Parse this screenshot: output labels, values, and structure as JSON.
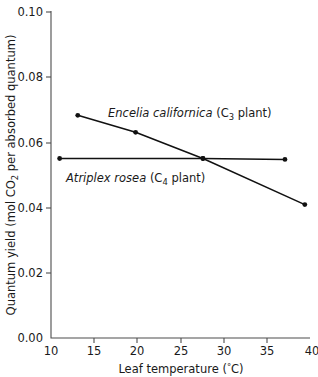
{
  "chart_data": {
    "type": "line",
    "title": "",
    "xlabel": "Leaf temperature (°C)",
    "ylabel": "Quantum yield (mol CO2 per absorbed quantum)",
    "xlim": [
      10,
      40
    ],
    "ylim": [
      0.0,
      0.1
    ],
    "grid": false,
    "legend_position": "inline-annotations",
    "xticks": [
      10,
      15,
      20,
      25,
      30,
      35,
      40
    ],
    "xtick_labels": [
      "10",
      "15",
      "20",
      "25",
      "30",
      "35",
      "40"
    ],
    "yticks": [
      0.0,
      0.02,
      0.04,
      0.06,
      0.08,
      0.1
    ],
    "ytick_labels": [
      "0.00",
      "0.02",
      "0.04",
      "0.06",
      "0.08",
      "0.10"
    ],
    "series": [
      {
        "name": "Encelia californica (C3 plant)",
        "species": "Encelia californica",
        "pathway_prefix": "(C",
        "pathway_number": "3",
        "pathway_suffix": " plant)",
        "marker": "filled-circle",
        "color": "#111111",
        "x": [
          13.1,
          19.8,
          27.6,
          39.4
        ],
        "y": [
          0.0681,
          0.0629,
          0.0549,
          0.0408
        ]
      },
      {
        "name": "Atriplex rosea (C4 plant)",
        "species": "Atriplex rosea",
        "pathway_prefix": "(C",
        "pathway_number": "4",
        "pathway_suffix": " plant)",
        "marker": "filled-circle",
        "color": "#111111",
        "x": [
          11.0,
          27.6,
          37.1
        ],
        "y": [
          0.0549,
          0.0549,
          0.0546
        ]
      }
    ]
  },
  "axes": {
    "y_title_parts": {
      "before": "Quantum yield (mol CO",
      "subscript": "2",
      "after": " per absorbed quantum)"
    },
    "x_title_parts": {
      "before": "Leaf temperature (",
      "degree": "°",
      "after": "C)"
    }
  }
}
